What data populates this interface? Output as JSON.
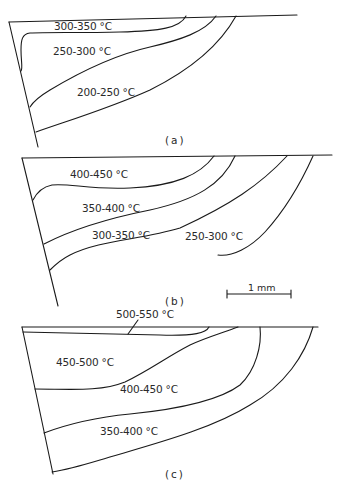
{
  "figure": {
    "panels": [
      {
        "caption": "(a)",
        "zones": [
          {
            "label": "300-350 °C"
          },
          {
            "label": "250-300 °C"
          },
          {
            "label": "200-250 °C"
          }
        ]
      },
      {
        "caption": "(b)",
        "zones": [
          {
            "label": "400-450 °C"
          },
          {
            "label": "350-400 °C"
          },
          {
            "label": "300-350 °C"
          },
          {
            "label": "250-300 °C"
          }
        ]
      },
      {
        "caption": "(c)",
        "zones": [
          {
            "label": "500-550 °C"
          },
          {
            "label": "450-500 °C"
          },
          {
            "label": "400-450 °C"
          },
          {
            "label": "350-400 °C"
          }
        ]
      }
    ],
    "scale_bar": {
      "label": "1 mm"
    },
    "line_color": "#1a1a1a",
    "background": "#ffffff"
  }
}
